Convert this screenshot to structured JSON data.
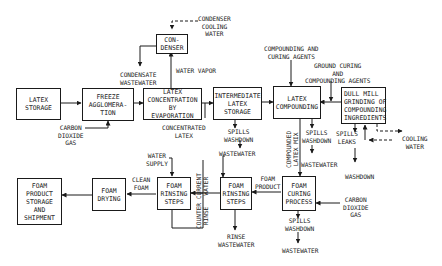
{
  "diagram": {
    "type": "process-flow",
    "boxes": {
      "condenser": "CON-\nDENSER",
      "latex_storage": "LATEX\nSTORAGE",
      "freeze_agglomeration": "FREEZE\nAGGLOMERA-\nTION",
      "latex_concentration": "LATEX\nCONCENTRATION\nBY\nEVAPORATION",
      "intermediate_storage": "INTERMEDIATE\nLATEX\nSTORAGE",
      "latex_compounding": "LATEX\nCOMPOUNDING",
      "dull_mill": "DULL MILL\nGRINDING OF\nCOMPOUNDING\nINGREDIENTS",
      "foam_curing": "FOAM\nCURING\nPROCESS",
      "foam_rinsing_right": "FOAM\nRINSING\nSTEPS",
      "foam_rinsing_left": "FOAM\nRINSING\nSTEPS",
      "foam_drying": "FOAM\nDRYING",
      "foam_product_storage": "FOAM\nPRODUCT\nSTORAGE\nAND\nSHIPMENT"
    },
    "labels": {
      "condenser_cooling_water": "CONDENSER\nCOOLING\nWATER",
      "water_vapor": "WATER VAPOR",
      "condensate_wastewater": "CONDENSATE\nWASTEWATER",
      "carbon_dioxide_gas_top": "CARBON\nDIOXIDE\nGAS",
      "concentrated_latex": "CONCENTRATED\nLATEX",
      "compounding_curing_agents": "COMPOUNDING AND\nCURING AGENTS",
      "ground_curing_agents": "GROUND CURING\nAND\nCOMPOUNDING AGENTS",
      "spills_washdown_storage": "SPILLS\nWASHDOWN",
      "wastewater_storage": "WASTEWATER",
      "compounded_latex_mix": "COMPOUNDED\nLATEX MIX",
      "spills_washdown_compounding": "SPILLS\nWASHDOWN",
      "wastewater_compounding": "WASTEWATER",
      "spills_leaks": "SPILLS\nLEAKS",
      "cooling_water": "COOLING\nWATER",
      "washdown": "WASHDOWN",
      "foam_product": "FOAM\nPRODUCT",
      "carbon_dioxide_gas_bottom": "CARBON\nDIOXIDE\nGAS",
      "spills_washdown_curing": "SPILLS\nWASHDOWN",
      "wastewater_curing": "WASTEWATER",
      "rinse_wastewater": "RINSE\nWASTEWATER",
      "water_supply": "WATER\nSUPPLY",
      "clean_foam": "CLEAN\nFOAM",
      "counter_current_water": "COUNTER CURRENT\nRINSE   WATER"
    }
  }
}
